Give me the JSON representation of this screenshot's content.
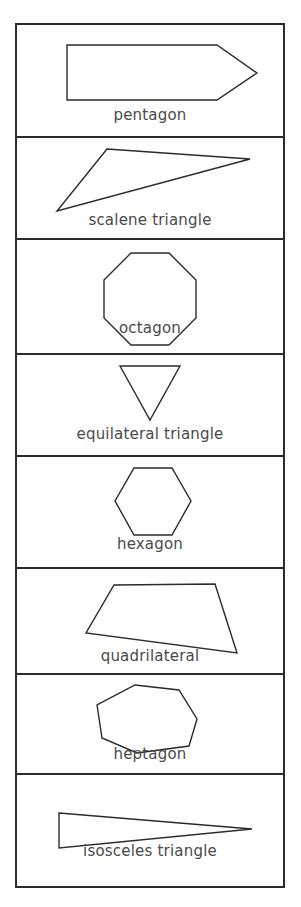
{
  "page": {
    "background_color": "#ffffff",
    "stroke_color": "#2b2b2b",
    "label_color": "#4a4a4a",
    "table_border_color": "#2b2b2b"
  },
  "table": {
    "rows": [
      {
        "id": "pentagon",
        "label": "pentagon",
        "shape": "pentagon",
        "sides": 5,
        "viewbox": "0 0 266 111",
        "points": "50,20 200,20 240,48 200,75 50,75"
      },
      {
        "id": "scalene-triangle",
        "label": "scalene triangle",
        "shape": "scalene triangle",
        "sides": 3,
        "viewbox": "0 0 266 100",
        "points": "90,11 233,21 40,73"
      },
      {
        "id": "octagon",
        "label": "octagon",
        "shape": "octagon",
        "sides": 8,
        "viewbox": "0 0 266 113",
        "points": "114,13 152,13 179,40 179,78 152,105 114,105 87,78 87,40"
      },
      {
        "id": "equilateral-triangle",
        "label": "equilateral triangle",
        "shape": "equilateral triangle",
        "sides": 3,
        "viewbox": "0 0 266 100",
        "points": "103,11 163,11 133,65"
      },
      {
        "id": "hexagon",
        "label": "hexagon",
        "shape": "hexagon",
        "sides": 6,
        "viewbox": "0 0 266 110",
        "points": "117,11 155,11 174,44 155,78 117,78 98,44"
      },
      {
        "id": "quadrilateral",
        "label": "quadrilateral",
        "shape": "quadrilateral",
        "sides": 4,
        "viewbox": "0 0 266 104",
        "points": "97,16 198,15 220,84 69,64"
      },
      {
        "id": "heptagon",
        "label": "heptagon",
        "shape": "heptagon",
        "sides": 7,
        "viewbox": "0 0 266 98",
        "points": "118,10 162,15 180,44 172,71 120,78 85,63 80,30"
      },
      {
        "id": "isosceles-triangle",
        "label": "isosceles triangle",
        "shape": "isosceles triangle",
        "sides": 3,
        "viewbox": "0 0 266 109",
        "points": "42,37 235,53 42,72"
      }
    ]
  }
}
